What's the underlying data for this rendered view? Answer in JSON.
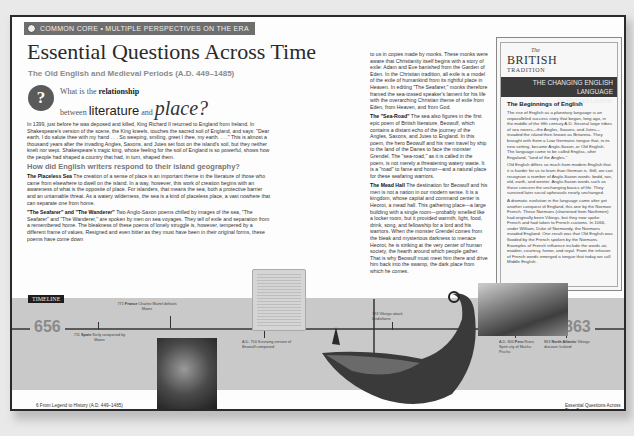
{
  "banner": {
    "label": "COMMON CORE • MULTIPLE PERSPECTIVES ON THE ERA"
  },
  "page_title": "Essential Questions Across Time",
  "subtitle": "The Old English and Medieval Periods (A.D. 449–1485)",
  "question": {
    "icon": "question-mark-icon",
    "line1_pre": "What is the ",
    "line1_bold": "relationship",
    "line2_pre": "between ",
    "line2_lit": "literature",
    "line2_and": " and ",
    "line2_place": "place?"
  },
  "column1": {
    "intro": "In 1399, just before he was deposed and killed, King Richard II returned to England from Ireland. In Shakespeare's version of the scene, the King kneels, touches the sacred soil of England, and says: \"Dear earth, I do salute thee with my hand . . . So weeping, smiling, greet I thee, my earth. . . .\" This is almost a thousand years after the invading Angles, Saxons, and Jutes set foot on the island's soil, but they neither knelt nor wept. Shakespeare's tragic king, whose feeling for the soil of England is so powerful, shows how the people had shaped a country that had, in turn, shaped them.",
    "heading": "How did English writers respond to their island geography?",
    "p1_lead": "The Placeless Sea",
    "p1": " The creation of a sense of place is an important theme in the literature of those who came from elsewhere to dwell on the island. In a way, however, this work of creation begins with an awareness of what is the opposite of place. For islanders, that means the sea, both a protective barrier and an untamable threat. As a watery wilderness, the sea is a kind of placeless place, a vast nowhere that can separate one from home.",
    "p2_lead": "\"The Seafarer\" and \"The Wanderer\"",
    "p2": " Two Anglo-Saxon poems chilled by images of the sea, \"The Seafarer\" and \"The Wanderer,\" are spoken by men on sea voyages. They tell of exile and separation from a remembered home. The bleakness of these poems of lonely struggle is, however, tempered by a different frame of values. Resigned and even bitter as they must have been in their original forms, these poems have come down"
  },
  "column2": {
    "p0": "to us in copies made by monks. These monks were aware that Christianity itself begins with a story of exile: Adam and Eve banished from the Garden of Eden. In the Christian tradition, all exile is a model of the exile of humankind from its rightful place in Heaven. In editing \"The Seafarer,\" monks therefore framed the sea-tossed speaker's lament for his life with the overarching Christian theme of exile from Eden, from Heaven, and from God.",
    "p1_lead": "The \"Sea-Road\"",
    "p1": " The sea also figures in the first epic poem of British literature, Beowulf, which contains a distant echo of the journey of the Angles, Saxons, and Jutes to England. In this poem, the hero Beowulf and his men travel by ship to the land of the Danes to face the monster Grendel. The \"sea-road,\" as it is called in the poem, is not merely a threatening watery waste. It is a \"road\" to fame and honor—and a natural place for these seafaring warriors.",
    "p2_lead": "The Mead Hall",
    "p2": " The destination for Beowulf and his men is not a nation in our modern sense. It is a kingdom, whose capital and command center is Heorot, a mead hall. This gathering place—a large building with a single room—probably smelled like a locker room, but it provided warmth, light, food, drink, song, and fellowship for a lord and his warriors. When the monster Grendel comes from the bleak and mysterious darkness to menace Heorot, he is striking at the very center of human society, the hearth around which people gather. That is why Beowulf must meet him there and drive him back into the swamp, the dark place from which he comes."
  },
  "sidebar": {
    "brand_the": "The",
    "brand_british": "BRITISH",
    "brand_tradition": "TRADITION",
    "band_title": "THE CHANGING ENGLISH LANGUAGE",
    "band_author": "by Richard Lederer",
    "heading": "The Beginnings of English",
    "p1": "The rise of English as a planetary language is an unparalleled success story that began, long ago, in the middle of the fifth century A.D. Several large tribes of sea rovers—the Angles, Saxons, and Jutes—invaded the island then known as Britannia. They brought with them a Low Germanic tongue that, in its new setting, became Anglo-Saxon, or Old English. The language came to be called Englisc, after Engaland, \"land of the Angles.\"",
    "p2": "Old English differs so much from modern English that it is harder for us to learn than German is. Still, we can recognize a number of Anglo-Saxon words: bedd, ran, old, earth, and weeter. Anglo-Saxon words such as these concern the unchanging basics of life. They survived later social upheavals nearly unchanged.",
    "p3": "A dramatic evolution in the language came after yet another conquest of England, this one by the Norman French. These Normans (shortened from Northmen) had originally been Vikings, but they now spoke French and had taken to French customs. In 1066, under William, Duke of Normandy, the Normans invaded England. One result was that Old English was flooded by the French spoken by the Normans. Examples of French influence include the words air, maiden, courtesy, honor, and royal. From the infusion of French words emerged a tongue that today we call Middle English."
  },
  "timeline": {
    "tab_label": "TIMELINE",
    "years": [
      "656",
      "863"
    ],
    "events": [
      {
        "date": "711",
        "bold": "Spain",
        "text": "Sicily conquered by Moors"
      },
      {
        "date": "771",
        "bold": "France",
        "text": "Charles Martel defeats Moors"
      },
      {
        "date": "A.D. 750",
        "bold": "",
        "text": "Surviving version of Beowulf composed"
      },
      {
        "date": "793",
        "bold": "",
        "text": "Vikings attack Lindisfarne"
      },
      {
        "date": "A.D. 800",
        "bold": "Peru",
        "text": "Rises Spirit city of Machu Picchu"
      },
      {
        "date": "863",
        "bold": "North Atlantic",
        "text": "Vikings discover Iceland"
      }
    ]
  },
  "footer": {
    "left": "6  From Legend to History (A.D. 449–1485)",
    "right": "Essential Questions Across Time  7"
  }
}
